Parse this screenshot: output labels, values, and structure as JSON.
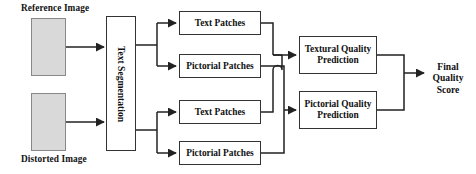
{
  "diagram": {
    "type": "flowchart",
    "inputs": [
      {
        "id": "reference-image",
        "label": "Reference Image",
        "label_position": "above",
        "fill": "#d9d9d9"
      },
      {
        "id": "distorted-image",
        "label": "Distorted Image",
        "label_position": "below",
        "fill": "#d9d9d9"
      }
    ],
    "segmentation": {
      "id": "text-segmentation",
      "label": "Text Segmentation",
      "orientation": "vertical"
    },
    "patches": [
      {
        "id": "text-patches-reference",
        "label": "Text Patches",
        "branch": "reference"
      },
      {
        "id": "pictorial-patches-reference",
        "label": "Pictorial Patches",
        "branch": "reference"
      },
      {
        "id": "text-patches-distorted",
        "label": "Text Patches",
        "branch": "distorted"
      },
      {
        "id": "pictorial-patches-distorted",
        "label": "Pictorial Patches",
        "branch": "distorted"
      }
    ],
    "predictors": [
      {
        "id": "textural-quality-prediction",
        "line1": "Textural Quality",
        "line2": "Prediction"
      },
      {
        "id": "pictorial-quality-prediction",
        "line1": "Pictorial Quality",
        "line2": "Prediction"
      }
    ],
    "output": {
      "id": "final-quality-score",
      "line1": "Final Quality",
      "line2": "Score"
    },
    "colors": {
      "stroke": "#333333",
      "image_fill": "#d9d9d9",
      "box_fill": "#ffffff",
      "text": "#111111",
      "background": "#ffffff"
    }
  }
}
